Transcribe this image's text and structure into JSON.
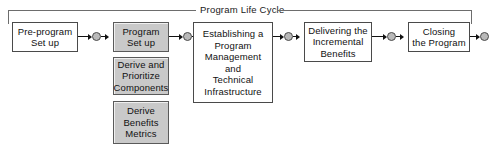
{
  "diagram": {
    "title_bracket": {
      "label": "Program Life Cycle",
      "icon": "bracket-span-icon"
    },
    "nodes": [
      {
        "id": "pre-program-set-up",
        "label": "Pre-program\nSet up",
        "lines": [
          "Pre-program",
          "Set up"
        ],
        "shaded": false
      },
      {
        "id": "program-set-up",
        "label": "Program\nSet up",
        "lines": [
          "Program",
          "Set up"
        ],
        "shaded": true
      },
      {
        "id": "derive-and-prioritize-components",
        "label": "Derive and\nPrioritize\nComponents",
        "lines": [
          "Derive and",
          "Prioritize",
          "Components"
        ],
        "shaded": true
      },
      {
        "id": "derive-benefits-metrics",
        "label": "Derive\nBenefits\nMetrics",
        "lines": [
          "Derive",
          "Benefits",
          "Metrics"
        ],
        "shaded": true
      },
      {
        "id": "establishing-a-program-management-and-technical-infrastructure",
        "label": "Establishing a\nProgram\nManagement\nand\nTechnical\nInfrastructure",
        "lines": [
          "Establishing a",
          "Program",
          "Management",
          "and",
          "Technical",
          "Infrastructure"
        ],
        "shaded": false
      },
      {
        "id": "delivering-the-incremental-benefits",
        "label": "Delivering the\nIncremental\nBenefits",
        "lines": [
          "Delivering the",
          "Incremental",
          "Benefits"
        ],
        "shaded": false
      },
      {
        "id": "closing-the-program",
        "label": "Closing\nthe Program",
        "lines": [
          "Closing",
          "the Program"
        ],
        "shaded": false
      }
    ],
    "connectors": [
      {
        "id": "connector-1",
        "from": "pre-program-set-up",
        "to": "program-set-up",
        "icon": "arrow-milestone-arrow-icon"
      },
      {
        "id": "connector-2",
        "from": "program-set-up",
        "to": "establishing-a-program-management-and-technical-infrastructure",
        "icon": "arrow-milestone-arrow-icon"
      },
      {
        "id": "connector-3",
        "from": "establishing-a-program-management-and-technical-infrastructure",
        "to": "delivering-the-incremental-benefits",
        "icon": "arrow-milestone-arrow-icon"
      },
      {
        "id": "connector-4",
        "from": "delivering-the-incremental-benefits",
        "to": "closing-the-program",
        "icon": "arrow-milestone-arrow-icon"
      },
      {
        "id": "connector-5",
        "from": "closing-the-program",
        "to": "end",
        "icon": "arrow-milestone-icon"
      }
    ],
    "colors": {
      "shaded_fill": "#c9c9c9",
      "box_border": "#4a4a4a",
      "bracket": "#6d6d6d",
      "connector": "#111111",
      "milestone_fill": "#b9b9b9",
      "background": "#ffffff",
      "text": "#111111"
    }
  }
}
